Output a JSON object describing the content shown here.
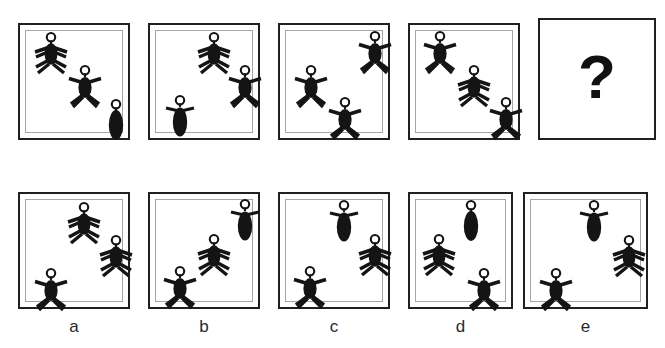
{
  "puzzle": {
    "title": "Figure matrix reasoning item",
    "question_mark": "?",
    "figure_types": {
      "arms_up": "person-arms-up",
      "arms_down": "person-arms-down",
      "oval": "oval-body-no-limbs",
      "oval_arms": "oval-body-with-arms"
    },
    "colors": {
      "figure": "#141414",
      "outer_border": "#231f20",
      "inner_border": "#a8a6a4",
      "background": "#ffffff",
      "label_text": "#2a2a2a"
    }
  },
  "stimulus_row": {
    "name": "stimulus-row",
    "panels": [
      {
        "id": "stimulus-1",
        "has_inner_frame": true,
        "figures": [
          {
            "type": "arms_down",
            "x": 9,
            "y": 5,
            "name": "figure-arms-down"
          },
          {
            "type": "arms_up",
            "x": 39,
            "y": 33,
            "name": "figure-arms-up"
          },
          {
            "type": "oval",
            "x": 67,
            "y": 62,
            "name": "figure-oval"
          }
        ]
      },
      {
        "id": "stimulus-2",
        "has_inner_frame": true,
        "figures": [
          {
            "type": "arms_down",
            "x": 38,
            "y": 5,
            "name": "figure-arms-down"
          },
          {
            "type": "arms_up",
            "x": 66,
            "y": 33,
            "name": "figure-arms-up"
          },
          {
            "type": "oval_arms",
            "x": 8,
            "y": 59,
            "name": "figure-oval-arms"
          }
        ]
      },
      {
        "id": "stimulus-3",
        "has_inner_frame": true,
        "figures": [
          {
            "type": "arms_up",
            "x": 66,
            "y": 4,
            "name": "figure-arms-up"
          },
          {
            "type": "arms_up",
            "x": 9,
            "y": 33,
            "name": "figure-arms-up"
          },
          {
            "type": "arms_up",
            "x": 39,
            "y": 61,
            "name": "figure-arms-up"
          }
        ]
      },
      {
        "id": "stimulus-4",
        "has_inner_frame": true,
        "figures": [
          {
            "type": "arms_up",
            "x": 8,
            "y": 4,
            "name": "figure-arms-up"
          },
          {
            "type": "arms_down",
            "x": 38,
            "y": 33,
            "name": "figure-arms-down"
          },
          {
            "type": "arms_up",
            "x": 67,
            "y": 61,
            "name": "figure-arms-up"
          }
        ]
      },
      {
        "id": "stimulus-question",
        "has_inner_frame": false,
        "is_question": true,
        "figures": []
      }
    ]
  },
  "options_row": {
    "name": "answer-options-row",
    "panels": [
      {
        "id": "option-a",
        "label": "a",
        "has_inner_frame": true,
        "figures": [
          {
            "type": "arms_down",
            "x": 38,
            "y": 6,
            "name": "figure-arms-down"
          },
          {
            "type": "arms_down",
            "x": 67,
            "y": 34,
            "name": "figure-arms-down"
          },
          {
            "type": "arms_up",
            "x": 9,
            "y": 62,
            "name": "figure-arms-up"
          }
        ]
      },
      {
        "id": "option-b",
        "label": "b",
        "has_inner_frame": true,
        "figures": [
          {
            "type": "oval_arms",
            "x": 66,
            "y": 3,
            "name": "figure-oval-arms"
          },
          {
            "type": "arms_down",
            "x": 38,
            "y": 33,
            "name": "figure-arms-down"
          },
          {
            "type": "arms_up",
            "x": 8,
            "y": 61,
            "name": "figure-arms-up"
          }
        ]
      },
      {
        "id": "option-c",
        "label": "c",
        "has_inner_frame": true,
        "figures": [
          {
            "type": "oval_arms",
            "x": 38,
            "y": 4,
            "name": "figure-oval-arms"
          },
          {
            "type": "arms_down",
            "x": 66,
            "y": 33,
            "name": "figure-arms-down"
          },
          {
            "type": "arms_up",
            "x": 8,
            "y": 61,
            "name": "figure-arms-up"
          }
        ]
      },
      {
        "id": "option-d",
        "label": "d",
        "has_inner_frame": true,
        "figures": [
          {
            "type": "oval",
            "x": 38,
            "y": 4,
            "name": "figure-oval"
          },
          {
            "type": "arms_down",
            "x": 8,
            "y": 33,
            "name": "figure-arms-down"
          },
          {
            "type": "arms_up",
            "x": 50,
            "y": 62,
            "name": "figure-arms-up"
          }
        ]
      },
      {
        "id": "option-e",
        "label": "e",
        "has_inner_frame": true,
        "figures": [
          {
            "type": "oval_arms",
            "x": 38,
            "y": 4,
            "name": "figure-oval-arms"
          },
          {
            "type": "arms_down",
            "x": 66,
            "y": 34,
            "name": "figure-arms-down"
          },
          {
            "type": "arms_up",
            "x": 8,
            "y": 62,
            "name": "figure-arms-up"
          }
        ]
      }
    ]
  },
  "layout": {
    "stimulus": {
      "panel_width": 112,
      "panel_height": 117,
      "top": 23,
      "lefts": [
        18,
        148,
        278,
        408,
        538
      ],
      "question_panel": {
        "left": 538,
        "top": 18,
        "width": 118,
        "height": 122
      }
    },
    "options": {
      "panel_width": 112,
      "panel_height": 117,
      "top": 192,
      "lefts": [
        18,
        148,
        278,
        408,
        523
      ],
      "widths": [
        112,
        112,
        112,
        105,
        125
      ],
      "label_top": 318
    }
  }
}
